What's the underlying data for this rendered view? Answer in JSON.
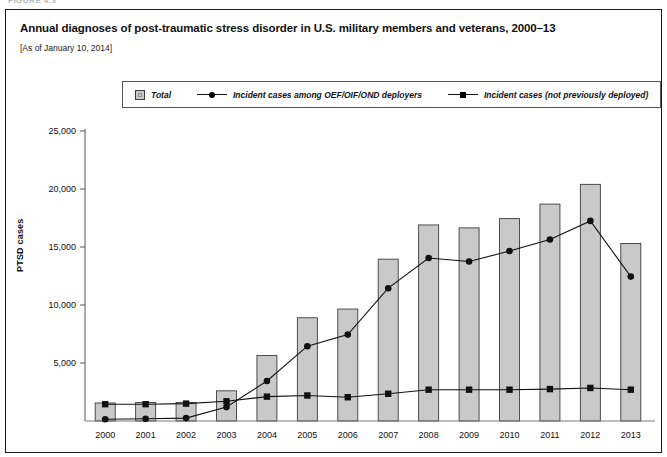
{
  "figure": {
    "figure_label": "FIGURE 4.3",
    "title": "Annual diagnoses of post-traumatic stress disorder in U.S. military members and veterans, 2000–13",
    "subtitle": "[As of January 10, 2014]"
  },
  "legend": {
    "position": "top-center-inside-box",
    "items": [
      {
        "label": "Total",
        "marker": "bar-swatch",
        "color": "#c9c9c9"
      },
      {
        "label": "Incident cases among OEF/OIF/OND deployers",
        "marker": "line-circle",
        "color": "#111111"
      },
      {
        "label": "Incident cases (not previously deployed)",
        "marker": "line-square",
        "color": "#111111"
      }
    ]
  },
  "axes": {
    "ylabel": "PTSD cases",
    "xlabel": "",
    "ytick_labels": [
      "25,000",
      "20,000",
      "15,000",
      "10,000",
      "5,000"
    ],
    "grid": "none"
  },
  "chart_data": {
    "type": "bar",
    "title": "Annual diagnoses of post-traumatic stress disorder in U.S. military members and veterans, 2000–13",
    "subtitle": "[As of January 10, 2014]",
    "xlabel": "",
    "ylabel": "PTSD cases",
    "ylim": [
      0,
      25000
    ],
    "yticks": [
      0,
      5000,
      10000,
      15000,
      20000,
      25000
    ],
    "ytick_labels": [
      "",
      "5,000",
      "10,000",
      "15,000",
      "20,000",
      "25,000"
    ],
    "grid": false,
    "legend_position": "top-center",
    "categories": [
      "2000",
      "2001",
      "2002",
      "2003",
      "2004",
      "2005",
      "2006",
      "2007",
      "2008",
      "2009",
      "2010",
      "2011",
      "2012",
      "2013"
    ],
    "series": [
      {
        "name": "Total",
        "type": "bar",
        "color": "#c9c9c9",
        "values": [
          1550,
          1600,
          1600,
          2600,
          5650,
          8900,
          9650,
          13950,
          16900,
          16650,
          17450,
          18700,
          20400,
          15300
        ]
      },
      {
        "name": "Incident cases among OEF/OIF/OND deployers",
        "type": "line",
        "marker": "circle",
        "color": "#111111",
        "values": [
          150,
          200,
          250,
          1200,
          3450,
          6450,
          7450,
          11450,
          14050,
          13750,
          14650,
          15650,
          17250,
          12450
        ]
      },
      {
        "name": "Incident cases (not previously deployed)",
        "type": "line",
        "marker": "square",
        "color": "#111111",
        "values": [
          1450,
          1450,
          1500,
          1700,
          2100,
          2200,
          2050,
          2350,
          2700,
          2700,
          2700,
          2750,
          2850,
          2700
        ]
      }
    ]
  }
}
